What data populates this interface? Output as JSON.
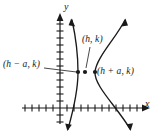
{
  "figure": {
    "type": "hyperbola-diagram",
    "stroke_color": "#1a1a1a",
    "background_color": "#ffffff"
  },
  "axes": {
    "x_label": "x",
    "y_label": "y",
    "x_axis_y": 108,
    "y_axis_x": 60,
    "tick_spacing": 7,
    "x_ticks_left": 5,
    "x_ticks_right": 11,
    "y_ticks_above": 12,
    "y_ticks_below": 2
  },
  "points": [
    {
      "name": "center",
      "label": "(h, k)",
      "cx": 85,
      "cy": 72
    },
    {
      "name": "left-vertex",
      "label": "(h − a, k)",
      "cx": 78,
      "cy": 72
    },
    {
      "name": "right-vertex",
      "label": "(h + a, k)",
      "cx": 95,
      "cy": 72
    }
  ],
  "curves": {
    "left_branch": "M 72,20 C 76,38 78,58 78,72 C 78,86 74,108 68,129",
    "right_branch": "M 125,20 C 116,38 96,58 95,72 C 94,86 118,108 130,129"
  },
  "leaders": {
    "center_leader": "M 90,46 L 86,68",
    "left_leader": "M 45,68 L 76,72"
  },
  "chart_data": {
    "type": "line",
    "title": "",
    "xlabel": "x",
    "ylabel": "y",
    "series": [
      {
        "name": "left branch",
        "x": [
          -1.2,
          -0.4,
          0.0,
          -0.4,
          -1.6
        ],
        "y": [
          7.4,
          4.6,
          0.0,
          -4.6,
          -8.1
        ]
      },
      {
        "name": "right branch",
        "x": [
          4.3,
          2.4,
          1.2,
          2.4,
          5.0
        ],
        "y": [
          7.4,
          4.6,
          0.0,
          -4.6,
          -8.1
        ]
      }
    ],
    "annotations": [
      {
        "text": "(h, k)",
        "x": 0.6,
        "y": 0.0
      },
      {
        "text": "(h − a, k)",
        "x": -0.4,
        "y": 0.0
      },
      {
        "text": "(h + a, k)",
        "x": 1.2,
        "y": 0.0
      }
    ],
    "grid": false,
    "legend": "none"
  }
}
